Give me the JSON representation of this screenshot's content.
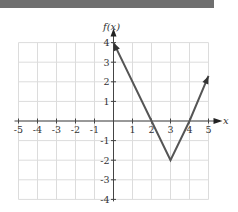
{
  "header": {
    "bar_color": "#6f6f6f"
  },
  "chart_data": {
    "type": "line",
    "title": "",
    "xlabel": "x",
    "ylabel": "f(x)",
    "xlim": [
      -5,
      5
    ],
    "ylim": [
      -4,
      4
    ],
    "grid": true,
    "x_ticks": [
      "-5",
      "-4",
      "-3",
      "-2",
      "-1",
      "1",
      "2",
      "3",
      "4",
      "5"
    ],
    "y_ticks": [
      "4",
      "3",
      "2",
      "1",
      "-1",
      "-2",
      "-3",
      "-4"
    ],
    "series": [
      {
        "name": "f(x)",
        "color": "#555555",
        "points": [
          [
            0,
            4
          ],
          [
            2,
            0
          ],
          [
            3,
            -2
          ],
          [
            4,
            0
          ],
          [
            5,
            2.3
          ]
        ],
        "arrow_start": true,
        "arrow_end": true
      }
    ],
    "annotations": {
      "x_intercepts": [
        2,
        4
      ],
      "y_intercept": 4,
      "minimum": [
        3,
        -2
      ]
    }
  }
}
